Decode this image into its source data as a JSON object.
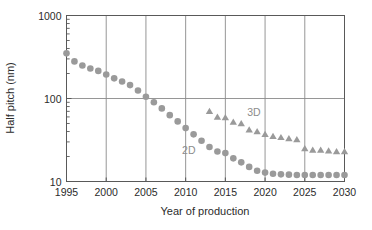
{
  "chart_data": {
    "type": "scatter",
    "title": "",
    "xlabel": "Year of production",
    "ylabel": "Half pitch (nm)",
    "xlim": [
      1995,
      2030
    ],
    "ylim": [
      10,
      1000
    ],
    "yscale": "log",
    "xscale": "linear",
    "grid": true,
    "grid_x_values": [
      2000,
      2005,
      2010,
      2015,
      2020,
      2025
    ],
    "grid_y_values": [
      100
    ],
    "xticks": [
      1995,
      2000,
      2005,
      2010,
      2015,
      2020,
      2025,
      2030
    ],
    "xticklabels": [
      "1995",
      "2000",
      "2005",
      "2010",
      "2015",
      "2020",
      "2025",
      "2030"
    ],
    "yticks": [
      10,
      100,
      1000
    ],
    "yticklabels": [
      "10",
      "100",
      "1000"
    ],
    "y_minor_ticks": [
      20,
      30,
      40,
      50,
      60,
      70,
      80,
      90,
      200,
      300,
      400,
      500,
      600,
      700,
      800,
      900
    ],
    "legend_position": "inline-annotation",
    "marker_color": "#9a9a9a",
    "annotations": [
      {
        "text": "2D",
        "x": 2010.4,
        "y": 21.5
      },
      {
        "text": "3D",
        "x": 2018.6,
        "y": 62.0
      }
    ],
    "series": [
      {
        "name": "2D",
        "marker": "circle",
        "color": "#9a9a9a",
        "x": [
          1995,
          1996,
          1997,
          1998,
          1999,
          2000,
          2001,
          2002,
          2003,
          2004,
          2005,
          2006,
          2007,
          2008,
          2009,
          2010,
          2011,
          2012,
          2013,
          2014,
          2015,
          2016,
          2017,
          2018,
          2019,
          2020,
          2021,
          2022,
          2023,
          2024,
          2025,
          2026,
          2027,
          2028,
          2029,
          2030
        ],
        "y": [
          350,
          280,
          250,
          230,
          215,
          195,
          175,
          160,
          145,
          125,
          105,
          90,
          76,
          63,
          53,
          44,
          37,
          31,
          26,
          23,
          22,
          19,
          17,
          15,
          13.5,
          12.8,
          12.4,
          12.2,
          12.1,
          12.0,
          12.0,
          12.0,
          12.0,
          12.0,
          12.0,
          12.0
        ]
      },
      {
        "name": "3D",
        "marker": "triangle",
        "color": "#9a9a9a",
        "x": [
          2013,
          2014,
          2015,
          2016,
          2017,
          2018,
          2019,
          2020,
          2021,
          2022,
          2023,
          2024,
          2025,
          2026,
          2027,
          2028,
          2029,
          2030
        ],
        "y": [
          70,
          60,
          59,
          52,
          50,
          42,
          40,
          37,
          35,
          34,
          33,
          32,
          25,
          24,
          24,
          23.5,
          23,
          23
        ]
      }
    ]
  }
}
